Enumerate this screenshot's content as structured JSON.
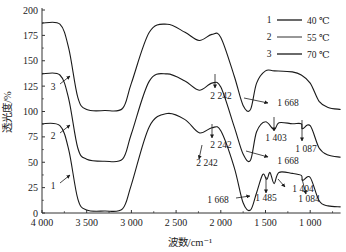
{
  "chart_data": {
    "type": "line",
    "title": "",
    "xlabel": "波数/cm⁻¹",
    "ylabel": "透光度/%",
    "xlim": [
      4000,
      660
    ],
    "ylim": [
      0,
      200
    ],
    "x_reversed": true,
    "grid": false,
    "legend_position": "top-right",
    "x_ticks": [
      4000,
      3500,
      3000,
      2500,
      2000,
      1500,
      1000
    ],
    "x_tick_labels": [
      "4 000",
      "3 500",
      "3 000",
      "2 500",
      "2 000",
      "1 500",
      "1 000"
    ],
    "y_ticks": [
      0,
      25,
      50,
      75,
      100,
      125,
      150,
      175,
      200
    ],
    "y_tick_labels": [
      "0",
      "25",
      "50",
      "75",
      "100",
      "125",
      "150",
      "175",
      "200"
    ],
    "legend": [
      {
        "num": "1",
        "label": "40 ℃"
      },
      {
        "num": "2",
        "label": "55 ℃"
      },
      {
        "num": "3",
        "label": "70 ℃"
      }
    ],
    "series": [
      {
        "name": "1 — 40 ℃",
        "curve_label": "1",
        "x": [
          4000,
          3800,
          3700,
          3600,
          3500,
          3300,
          3100,
          3000,
          2800,
          2600,
          2400,
          2242,
          2100,
          2000,
          1850,
          1750,
          1668,
          1600,
          1530,
          1485,
          1450,
          1404,
          1350,
          1200,
          1100,
          1084,
          1000,
          900,
          800,
          660
        ],
        "values": [
          88,
          86,
          62,
          14,
          3,
          2,
          4,
          28,
          85,
          98,
          92,
          79,
          84,
          81,
          45,
          10,
          3,
          20,
          38,
          33,
          40,
          29,
          40,
          39,
          37,
          32,
          35,
          12,
          7,
          6
        ]
      },
      {
        "name": "2 — 55 ℃",
        "curve_label": "2",
        "x": [
          4000,
          3800,
          3700,
          3600,
          3500,
          3300,
          3100,
          3000,
          2800,
          2600,
          2400,
          2242,
          2100,
          2000,
          1850,
          1750,
          1668,
          1600,
          1500,
          1403,
          1350,
          1200,
          1100,
          1087,
          1000,
          900,
          800,
          660
        ],
        "values": [
          137,
          136,
          112,
          64,
          53,
          51,
          53,
          78,
          130,
          137,
          130,
          121,
          128,
          124,
          85,
          58,
          52,
          80,
          90,
          82,
          89,
          88,
          88,
          83,
          86,
          64,
          57,
          55
        ]
      },
      {
        "name": "3 — 70 ℃",
        "curve_label": "3",
        "x": [
          4000,
          3800,
          3700,
          3600,
          3500,
          3300,
          3100,
          3000,
          2800,
          2600,
          2400,
          2242,
          2100,
          2000,
          1850,
          1750,
          1668,
          1600,
          1500,
          1400,
          1200,
          1100,
          1000,
          900,
          800,
          660
        ],
        "values": [
          187,
          186,
          162,
          114,
          102,
          101,
          103,
          128,
          178,
          186,
          178,
          170,
          176,
          173,
          135,
          106,
          102,
          128,
          140,
          140,
          139,
          136,
          128,
          110,
          104,
          102
        ]
      }
    ],
    "annotations": [
      {
        "text": "2 242",
        "series": "3",
        "x": 2242
      },
      {
        "text": "1 668",
        "series": "3",
        "x": 1668
      },
      {
        "text": "2 242",
        "series": "2",
        "x": 2242
      },
      {
        "text": "1 668",
        "series": "2",
        "x": 1668
      },
      {
        "text": "1 403",
        "series": "2",
        "x": 1403
      },
      {
        "text": "1 087",
        "series": "2",
        "x": 1087
      },
      {
        "text": "2 242",
        "series": "1",
        "x": 2242
      },
      {
        "text": "1 668",
        "series": "1",
        "x": 1668
      },
      {
        "text": "1 485",
        "series": "1",
        "x": 1485
      },
      {
        "text": "1 404",
        "series": "1",
        "x": 1404
      },
      {
        "text": "1 084",
        "series": "1",
        "x": 1084
      }
    ]
  }
}
